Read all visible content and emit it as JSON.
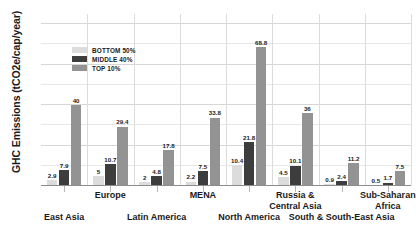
{
  "chart_data": {
    "type": "bar",
    "title": "",
    "xlabel": "",
    "ylabel": "GHC Emissions (tCO2e/cap/year)",
    "ylim": [
      0,
      85
    ],
    "yticks": [
      0,
      20,
      40,
      60,
      80
    ],
    "yticks_minor": [
      10,
      30,
      50,
      70
    ],
    "grid": true,
    "legend_position": "upper-left-inside",
    "categories": [
      "East Asia",
      "Europe",
      "Latin America",
      "MENA",
      "North America",
      "Russia & Central Asia",
      "South & South-East Asia",
      "Sub-Saharan Africa"
    ],
    "category_lines": [
      [
        "East Asia"
      ],
      [
        "Europe"
      ],
      [
        "Latin America"
      ],
      [
        "MENA"
      ],
      [
        "North America"
      ],
      [
        "Russia &",
        "Central Asia"
      ],
      [
        "South & South-East Asia"
      ],
      [
        "Sub-Saharan",
        "Africa"
      ]
    ],
    "series": [
      {
        "name": "BOTTOM 50%",
        "color": "#dcdcdc",
        "values": [
          2.9,
          5,
          2,
          2.2,
          10.4,
          4.5,
          0.9,
          0.5
        ],
        "labels": [
          "2.9",
          "5",
          "2",
          "2.2",
          "10.4",
          "4.5",
          "0.9",
          "0.5"
        ]
      },
      {
        "name": "MIDDLE 40%",
        "color": "#3d3d3d",
        "values": [
          7.9,
          10.7,
          4.8,
          7.5,
          21.8,
          10.1,
          2.4,
          1.7
        ],
        "labels": [
          "7.9",
          "10.7",
          "4.8",
          "7.5",
          "21.8",
          "10.1",
          "2.4",
          "1.7"
        ]
      },
      {
        "name": "TOP 10%",
        "color": "#939393",
        "values": [
          40,
          29.4,
          17.8,
          33.8,
          68.8,
          36,
          11.2,
          7.5
        ],
        "labels": [
          "40",
          "29.4",
          "17.8",
          "33.8",
          "68.8",
          "36",
          "11.2",
          "7.5"
        ]
      }
    ]
  }
}
